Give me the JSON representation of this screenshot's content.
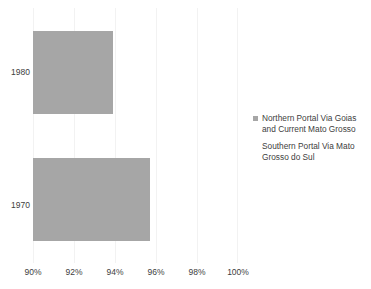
{
  "chart_data": {
    "type": "bar",
    "orientation": "horizontal",
    "title": "",
    "xlabel": "",
    "ylabel": "",
    "categories": [
      "1980",
      "1970"
    ],
    "series": [
      {
        "name": "Northern Portal Via Goias and Current Mato Grosso",
        "values": [
          93.9,
          95.7
        ],
        "color": "#a6a6a6"
      },
      {
        "name": "Southern Portal Via Mato Grosso do Sul",
        "values": [
          0,
          0
        ],
        "color": "#ffffff"
      }
    ],
    "xlim": [
      90,
      100
    ],
    "xticks": [
      "90%",
      "92%",
      "94%",
      "96%",
      "98%",
      "100%"
    ],
    "xtick_values": [
      90,
      92,
      94,
      96,
      98,
      100
    ],
    "grid": true,
    "legend_position": "right"
  },
  "axes": {
    "y": {
      "ticks": [
        {
          "label": "1980"
        },
        {
          "label": "1970"
        }
      ]
    },
    "x": {
      "ticks": [
        {
          "label": "90%"
        },
        {
          "label": "92%"
        },
        {
          "label": "94%"
        },
        {
          "label": "96%"
        },
        {
          "label": "98%"
        },
        {
          "label": "100%"
        }
      ]
    }
  },
  "legend": {
    "entries": [
      {
        "line1": "Northern Portal Via Goias",
        "line2": "and Current Mato Grosso",
        "color": "#a6a6a6"
      },
      {
        "line1": "Southern Portal Via Mato",
        "line2": "Grosso do Sul",
        "color": "#ffffff"
      }
    ]
  },
  "colors": {
    "bar": "#a6a6a6",
    "gridline": "#f2f2f2",
    "text": "#404040",
    "background": "#ffffff"
  }
}
